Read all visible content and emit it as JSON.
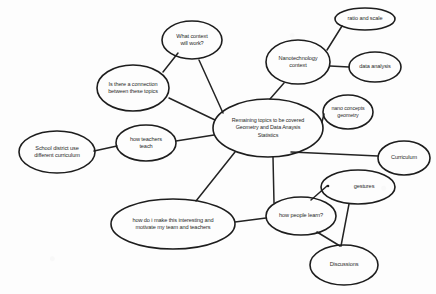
{
  "diagram": {
    "type": "concept-map",
    "background_color": "#fdfdfd",
    "stroke_color": "#1d1d1d",
    "text_color": "#2a2a2a",
    "nodes": [
      {
        "id": "center",
        "lines": [
          "Remaining topics to be covered",
          "Geometry and Data Anaysis",
          "Statistics"
        ],
        "cx": 268,
        "cy": 128,
        "rx": 55,
        "ry": 29,
        "font_size": 5.4,
        "line_height": 7.2
      },
      {
        "id": "what-context",
        "lines": [
          "What context",
          "will work?"
        ],
        "cx": 192,
        "cy": 40,
        "rx": 30,
        "ry": 19,
        "font_size": 5.6,
        "line_height": 7.6
      },
      {
        "id": "is-there-connection",
        "lines": [
          "Is there a connection",
          "between these topics"
        ],
        "cx": 133,
        "cy": 88,
        "rx": 36,
        "ry": 23,
        "font_size": 5.5,
        "line_height": 7.6
      },
      {
        "id": "how-teachers-teach",
        "lines": [
          "how teachers",
          "teach"
        ],
        "cx": 146,
        "cy": 143,
        "rx": 30,
        "ry": 18,
        "font_size": 5.6,
        "line_height": 7.6
      },
      {
        "id": "school-district",
        "lines": [
          "School district use",
          "different curriculum"
        ],
        "cx": 57,
        "cy": 152,
        "rx": 38,
        "ry": 21,
        "font_size": 5.6,
        "line_height": 7.6
      },
      {
        "id": "how-do-i-make",
        "lines": [
          "how do i make this interesting and",
          "motivate my team and teachers"
        ],
        "cx": 173,
        "cy": 224,
        "rx": 62,
        "ry": 25,
        "font_size": 5.6,
        "line_height": 7.6
      },
      {
        "id": "nanotechnology",
        "lines": [
          "Nanotechnology",
          "context"
        ],
        "cx": 298,
        "cy": 62,
        "rx": 32,
        "ry": 22,
        "font_size": 5.6,
        "line_height": 7.6
      },
      {
        "id": "ratio-and-scale",
        "lines": [
          "ratio and scale"
        ],
        "cx": 365,
        "cy": 19,
        "rx": 30,
        "ry": 11,
        "font_size": 5.6,
        "line_height": 7.6
      },
      {
        "id": "data-analysis",
        "lines": [
          "data analysis"
        ],
        "cx": 375,
        "cy": 67,
        "rx": 26,
        "ry": 15,
        "font_size": 5.6,
        "line_height": 7.6
      },
      {
        "id": "nano-concepts",
        "lines": [
          "nano concepts",
          "geometry"
        ],
        "cx": 348,
        "cy": 112,
        "rx": 25,
        "ry": 17,
        "font_size": 5.3,
        "line_height": 7.0
      },
      {
        "id": "curriculum",
        "lines": [
          "Curriculum"
        ],
        "cx": 404,
        "cy": 158,
        "rx": 26,
        "ry": 17,
        "font_size": 5.6,
        "line_height": 7.6
      },
      {
        "id": "gestures",
        "lines": [
          "gestures"
        ],
        "cx": 358,
        "cy": 187,
        "rx": 37,
        "ry": 17,
        "font_size": 5.6,
        "line_height": 7.6,
        "bullet": true
      },
      {
        "id": "how-people-learn",
        "lines": [
          "how people learn?"
        ],
        "cx": 301,
        "cy": 216,
        "rx": 35,
        "ry": 19,
        "font_size": 5.6,
        "line_height": 7.6
      },
      {
        "id": "discussions",
        "lines": [
          "Discussions"
        ],
        "cx": 344,
        "cy": 265,
        "rx": 34,
        "ry": 20,
        "font_size": 5.6,
        "line_height": 7.6
      }
    ],
    "edges": [
      {
        "id": "center-to-what-context",
        "from": "center",
        "to": "what-context",
        "d": "M 223 113 L 199 60"
      },
      {
        "id": "what-context-to-connection",
        "from": "what-context",
        "to": "is-there-connection",
        "d": "M 178 53 L 163 72"
      },
      {
        "id": "center-to-connection",
        "from": "center",
        "to": "is-there-connection",
        "d": "M 215 120 L 169 98"
      },
      {
        "id": "center-to-how-teachers",
        "from": "center",
        "to": "how-teachers-teach",
        "d": "M 214 135 L 176 141"
      },
      {
        "id": "teachers-to-district",
        "from": "how-teachers-teach",
        "to": "school-district",
        "d": "M 117 146 L 94 151"
      },
      {
        "id": "center-to-motivate",
        "from": "center",
        "to": "how-do-i-make",
        "d": "M 235 152 L 196 201"
      },
      {
        "id": "center-to-nanotech",
        "from": "center",
        "to": "nanotechnology",
        "d": "M 270 99 L 284 83"
      },
      {
        "id": "nanotech-to-ratio",
        "from": "nanotechnology",
        "to": "ratio-and-scale",
        "d": "M 327 50 L 342 26"
      },
      {
        "id": "nanotech-to-data",
        "from": "nanotechnology",
        "to": "data-analysis",
        "d": "M 330 66 L 349 67"
      },
      {
        "id": "center-to-nano-concepts",
        "from": "center",
        "to": "nano-concepts",
        "d": "M 322 122 L 324 114"
      },
      {
        "id": "center-to-curriculum",
        "from": "center",
        "to": "curriculum",
        "d": "M 291 152 L 378 156"
      },
      {
        "id": "center-to-gestures",
        "from": "center",
        "to": "gestures",
        "d": "M 273 157 L 274 203"
      },
      {
        "id": "people-learn-to-gestures",
        "from": "how-people-learn",
        "to": "gestures",
        "d": "M 311 200 L 327 186"
      },
      {
        "id": "motivate-to-people-learn",
        "from": "how-do-i-make",
        "to": "how-people-learn",
        "d": "M 235 222 L 266 218"
      },
      {
        "id": "people-learn-to-discussions",
        "from": "how-people-learn",
        "to": "discussions",
        "d": "M 317 232 L 340 246"
      },
      {
        "id": "gestures-to-discussions",
        "from": "gestures",
        "to": "discussions",
        "d": "M 349 204 L 341 246"
      }
    ]
  }
}
